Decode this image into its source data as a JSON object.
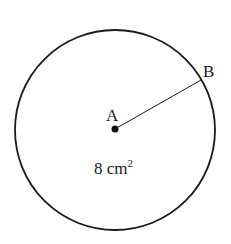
{
  "diagram": {
    "circle": {
      "cx": 115,
      "cy": 130,
      "r": 100,
      "stroke": "#1a1a1a"
    },
    "center_point": {
      "label": "A",
      "x": 115,
      "y": 129
    },
    "edge_point": {
      "label": "B",
      "x": 201,
      "y": 80
    },
    "area_label": {
      "value": "8 cm",
      "superscript": "2"
    }
  }
}
